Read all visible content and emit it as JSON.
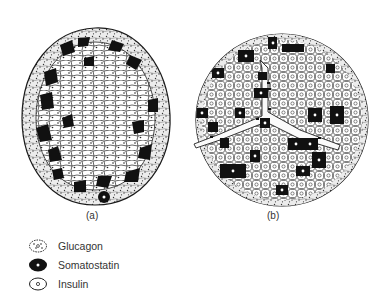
{
  "figure": {
    "panels": [
      {
        "id": "a",
        "label": "(a)"
      },
      {
        "id": "b",
        "label": "(b)"
      }
    ],
    "legend": [
      {
        "key": "glucagon",
        "label": "Glucagon",
        "icon": "dotted-cell-icon"
      },
      {
        "key": "somatostatin",
        "label": "Somatostatin",
        "icon": "black-cell-icon"
      },
      {
        "key": "insulin",
        "label": "Insulin",
        "icon": "open-cell-icon"
      }
    ],
    "colors": {
      "ink": "#1a1a1a",
      "cell_fill": "#ffffff",
      "glucagon_fill": "#e6e6e6",
      "background": "#ffffff"
    }
  }
}
